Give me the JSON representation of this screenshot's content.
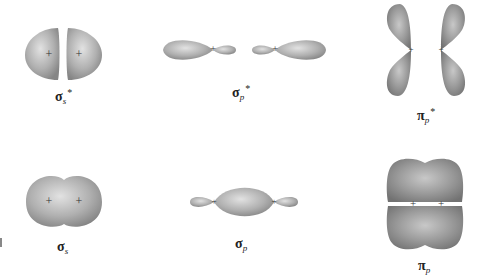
{
  "figure": {
    "colors": {
      "lobe_fill": "#a6a6a6",
      "lobe_light": "#dcdcdc",
      "lobe_dark": "#7d7d7d",
      "node_mark": "#333333"
    },
    "orbitals": [
      {
        "id": "sigma_s_star",
        "greek": "σ",
        "subscript": "s",
        "superscript": "*",
        "row": "antibonding"
      },
      {
        "id": "sigma_p_star",
        "greek": "σ",
        "subscript": "p",
        "superscript": "*",
        "row": "antibonding"
      },
      {
        "id": "pi_p_star",
        "greek": "π",
        "subscript": "p",
        "superscript": "*",
        "row": "antibonding"
      },
      {
        "id": "sigma_s",
        "greek": "σ",
        "subscript": "s",
        "superscript": "",
        "row": "bonding"
      },
      {
        "id": "sigma_p",
        "greek": "σ",
        "subscript": "p",
        "superscript": "",
        "row": "bonding"
      },
      {
        "id": "pi_p",
        "greek": "π",
        "subscript": "p",
        "superscript": "",
        "row": "bonding"
      }
    ],
    "nucleus_marker": "+"
  }
}
